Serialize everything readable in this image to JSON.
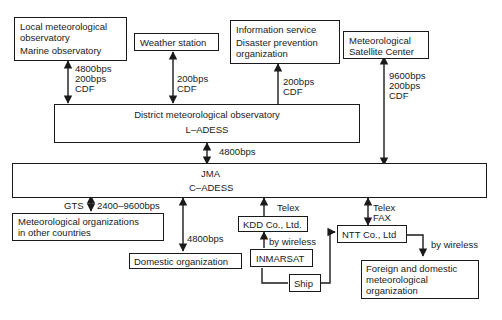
{
  "nodes": {
    "local": {
      "line1": "Local meteorological",
      "line2": "observatory",
      "line3": "Marine observatory"
    },
    "weather": {
      "label": "Weather station"
    },
    "info": {
      "line1": "Information service",
      "line2": "Disaster prevention",
      "line3": "organization"
    },
    "satellite": {
      "line1": "Meteorological",
      "line2": "Satellite Center"
    },
    "district": {
      "line1": "District meteorological observatory",
      "line2": "L–ADESS"
    },
    "jma": {
      "line1": "JMA",
      "line2": "C–ADESS"
    },
    "foreign_met": {
      "line1": "Meteorological organizations",
      "line2": "in other countries"
    },
    "domestic": {
      "label": "Domestic organization"
    },
    "kdd": {
      "label": "KDD Co., Ltd."
    },
    "inmarsat": {
      "label": "INMARSAT"
    },
    "ship": {
      "label": "Ship"
    },
    "ntt": {
      "label": "NTT Co., Ltd"
    },
    "fd_met": {
      "line1": "Foreign and domestic",
      "line2": "meteorological",
      "line3": "organization"
    }
  },
  "links": {
    "local_district": {
      "line1": "4800bps",
      "line2": "200bps",
      "line3": "CDF"
    },
    "weather_district": {
      "line1": "200bps",
      "line2": "CDF"
    },
    "info_district": {
      "line1": "200bps",
      "line2": "CDF"
    },
    "satellite_jma": {
      "line1": "9600bps",
      "line2": "200bps",
      "line3": "CDF"
    },
    "district_jma": {
      "label": "4800bps"
    },
    "gts": {
      "left": "GTS",
      "right": "2400–9600bps"
    },
    "domestic_jma": {
      "label": "4800bps"
    },
    "kdd_jma": {
      "label": "Telex"
    },
    "ntt_jma": {
      "line1": "Telex",
      "line2": "FAX"
    },
    "inmarsat_kdd": {
      "label": "by wireless"
    },
    "ntt_fd": {
      "label": "by wireless"
    }
  }
}
